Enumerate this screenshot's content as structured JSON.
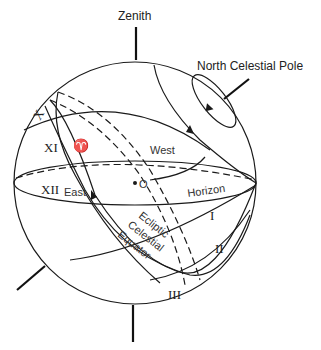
{
  "diagram": {
    "type": "celestial-sphere",
    "labels": {
      "zenith": "Zenith",
      "ncp": "North Celestial Pole",
      "west": "West",
      "east": "East",
      "horizon": "Horizon",
      "observer": "O",
      "ecliptic": "Ecliptic",
      "celestial": "Celestial",
      "equator": "Equator",
      "vernal_equinox": "♈"
    },
    "hour_markers": [
      "I",
      "II",
      "III",
      "X",
      "XI",
      "XII"
    ],
    "colors": {
      "ink": "#1a1a1a",
      "background": "#ffffff"
    }
  }
}
